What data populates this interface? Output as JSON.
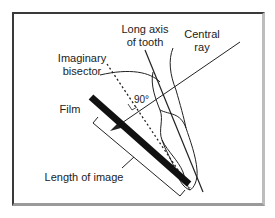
{
  "diagram": {
    "labels": {
      "long_axis_line1": "Long axis",
      "long_axis_line2": "of tooth",
      "central_ray_line1": "Central",
      "central_ray_line2": "ray",
      "bisector_line1": "Imaginary",
      "bisector_line2": "bisector",
      "angle": "90°",
      "film": "Film",
      "length_of_image": "Length of image"
    },
    "colors": {
      "line": "#222222",
      "film": "#111111",
      "frame_dark": "#3a3a3a",
      "frame_light": "#bdbdbd"
    }
  }
}
